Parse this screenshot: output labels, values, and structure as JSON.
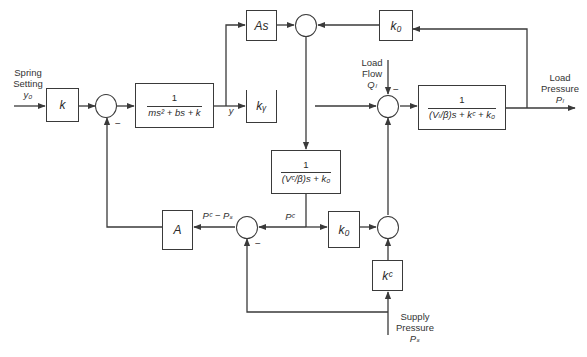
{
  "diagram": {
    "type": "block-diagram",
    "title": "",
    "inputs": {
      "spring_setting": {
        "line1": "Spring",
        "line2": "Setting",
        "symbol": "y₀"
      },
      "load_flow": {
        "line1": "Load",
        "line2": "Flow",
        "symbol": "Qₗ"
      },
      "supply_pressure": {
        "line1": "Supply",
        "line2": "Pressure",
        "symbol": "Pₛ"
      }
    },
    "outputs": {
      "load_pressure": {
        "line1": "Load",
        "line2": "Pressure",
        "symbol": "Pₗ"
      }
    },
    "blocks": {
      "spring_gain": "k",
      "plant": {
        "num": "1",
        "den": "ms² + bs + k"
      },
      "area_derivative": "As",
      "valve_gain": "kᵧ",
      "top_orifice": "k₀",
      "load_volume": {
        "num": "1",
        "den": "(Vₗ/β)s + kᶜ + k₀"
      },
      "control_volume": {
        "num": "1",
        "den": "(Vᶜ/β)s + k₀"
      },
      "area_gain": "A",
      "bottom_orifice": "k₀",
      "leakage_gain": "kᶜ"
    },
    "signals": {
      "spool_position": "y",
      "control_pressure": "Pᶜ",
      "pressure_difference": "Pᶜ − Pₛ"
    },
    "signs": {
      "sum1_feedback": "−",
      "pc_sum_supply": "−",
      "load_sum_flow": "−"
    }
  }
}
